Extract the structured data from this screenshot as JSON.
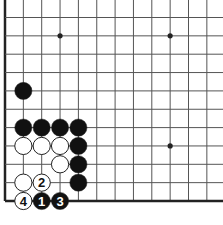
{
  "diagram": {
    "type": "go-board-fragment",
    "visible_edges": [
      "left",
      "bottom"
    ],
    "colors": {
      "line": "#555555",
      "edge": "#222222",
      "black_stone": "#111111",
      "white_stone": "#ffffff",
      "white_stone_border": "#222222",
      "label_on_black": "#ffffff",
      "label_on_white": "#111111"
    },
    "star_points": [
      {
        "col": 3,
        "row": 9
      },
      {
        "col": 9,
        "row": 9
      },
      {
        "col": 9,
        "row": 3
      }
    ],
    "stones": [
      {
        "color": "black",
        "col": 1,
        "row": 6,
        "label": ""
      },
      {
        "color": "black",
        "col": 1,
        "row": 4,
        "label": ""
      },
      {
        "color": "black",
        "col": 2,
        "row": 4,
        "label": ""
      },
      {
        "color": "black",
        "col": 3,
        "row": 4,
        "label": ""
      },
      {
        "color": "black",
        "col": 4,
        "row": 4,
        "label": ""
      },
      {
        "color": "white",
        "col": 1,
        "row": 3,
        "label": ""
      },
      {
        "color": "white",
        "col": 2,
        "row": 3,
        "label": ""
      },
      {
        "color": "white",
        "col": 3,
        "row": 3,
        "label": ""
      },
      {
        "color": "black",
        "col": 4,
        "row": 3,
        "label": ""
      },
      {
        "color": "white",
        "col": 3,
        "row": 2,
        "label": ""
      },
      {
        "color": "black",
        "col": 4,
        "row": 2,
        "label": ""
      },
      {
        "color": "white",
        "col": 1,
        "row": 1,
        "label": ""
      },
      {
        "color": "white",
        "col": 2,
        "row": 1,
        "label": "2"
      },
      {
        "color": "black",
        "col": 4,
        "row": 1,
        "label": ""
      },
      {
        "color": "white",
        "col": 1,
        "row": 0,
        "label": "4"
      },
      {
        "color": "black",
        "col": 2,
        "row": 0,
        "label": "1"
      },
      {
        "color": "black",
        "col": 3,
        "row": 0,
        "label": "3"
      }
    ]
  }
}
